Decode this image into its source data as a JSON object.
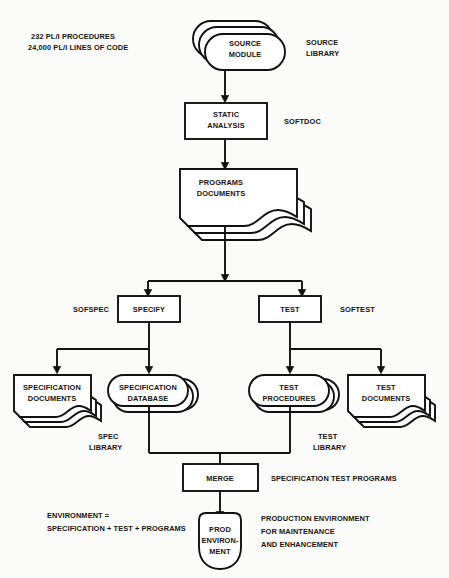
{
  "diagram": {
    "stroke_color": "#111111",
    "background_color": "#fbfbfa",
    "annotations": {
      "procedures": "232 PL/I PROCEDURES",
      "lines_of_code": "24,000 PL/I LINES OF CODE",
      "environment_def_line1": "ENVIRONMENT =",
      "environment_def_line2": "SPECIFICATION + TEST + PROGRAMS",
      "production_line1": "PRODUCTION ENVIRONMENT",
      "production_line2": "FOR MAINTENANCE",
      "production_line3": "AND ENHANCEMENT",
      "merge_outputs": "SPECIFICATION TEST PROGRAMS"
    },
    "side_labels": {
      "source_library_line1": "SOURCE",
      "source_library_line2": "LIBRARY",
      "softdoc": "SOFTDOC",
      "sofspec": "SOFSPEC",
      "softest": "SOFTEST",
      "spec_library_line1": "SPEC",
      "spec_library_line2": "LIBRARY",
      "test_library_line1": "TEST",
      "test_library_line2": "LIBRARY"
    },
    "nodes": [
      {
        "id": "source-module",
        "shape": "stacked-rounded",
        "line1": "SOURCE",
        "line2": "MODULE"
      },
      {
        "id": "static-analysis",
        "shape": "rect",
        "line1": "STATIC",
        "line2": "ANALYSIS"
      },
      {
        "id": "programs-documents",
        "shape": "stacked-document",
        "line1": "PROGRAMS",
        "line2": "DOCUMENTS"
      },
      {
        "id": "specify",
        "shape": "rect",
        "line1": "SPECIFY",
        "line2": ""
      },
      {
        "id": "test",
        "shape": "rect",
        "line1": "TEST",
        "line2": ""
      },
      {
        "id": "specification-documents",
        "shape": "stacked-document",
        "line1": "SPECIFICATION",
        "line2": "DOCUMENTS"
      },
      {
        "id": "specification-database",
        "shape": "stacked-rounded",
        "line1": "SPECIFICATION",
        "line2": "DATABASE"
      },
      {
        "id": "test-procedures",
        "shape": "stacked-rounded",
        "line1": "TEST",
        "line2": "PROCEDURES"
      },
      {
        "id": "test-documents",
        "shape": "stacked-document",
        "line1": "TEST",
        "line2": "DOCUMENTS"
      },
      {
        "id": "merge",
        "shape": "rect",
        "line1": "MERGE",
        "line2": ""
      },
      {
        "id": "prod-environment",
        "shape": "shield",
        "line1": "PROD",
        "line2": "ENVIRON-",
        "line3": "MENT"
      }
    ]
  }
}
